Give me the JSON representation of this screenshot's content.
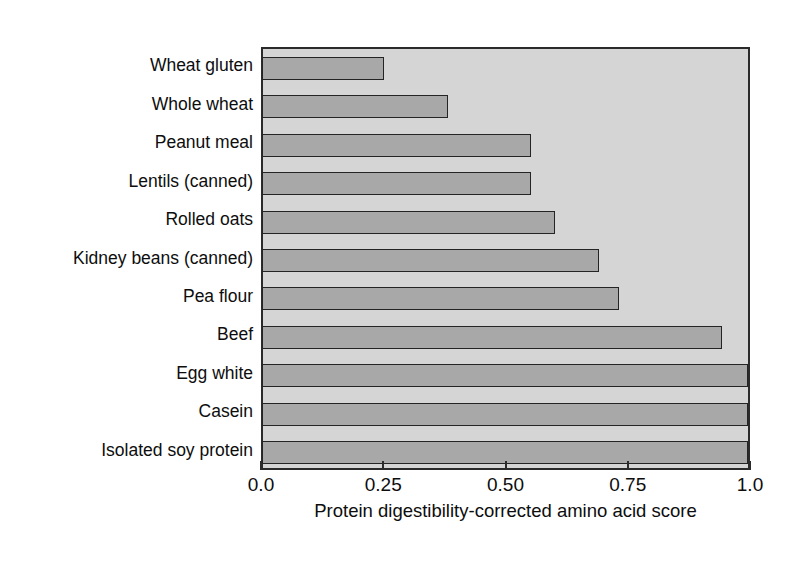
{
  "chart_data": {
    "type": "bar",
    "orientation": "horizontal",
    "title": "",
    "xlabel": "Protein digestibility-corrected amino acid score",
    "ylabel": "",
    "xlim": [
      0.0,
      1.0
    ],
    "grid": false,
    "legend": null,
    "xticks": [
      "0.0",
      "0.25",
      "0.50",
      "0.75",
      "1.0"
    ],
    "xtick_values": [
      0.0,
      0.25,
      0.5,
      0.75,
      1.0
    ],
    "categories": [
      "Wheat gluten",
      "Whole wheat",
      "Peanut meal",
      "Lentils (canned)",
      "Rolled oats",
      "Kidney beans (canned)",
      "Pea flour",
      "Beef",
      "Egg white",
      "Casein",
      "Isolated soy protein"
    ],
    "values": [
      0.25,
      0.38,
      0.55,
      0.55,
      0.6,
      0.69,
      0.73,
      0.94,
      1.0,
      1.0,
      1.0
    ],
    "colors": {
      "bar_fill": "#a8a8a8",
      "bar_edge": "#242424",
      "plot_background": "#d5d5d5",
      "figure_background": "#ffffff",
      "text": "#0d0d0d"
    }
  }
}
